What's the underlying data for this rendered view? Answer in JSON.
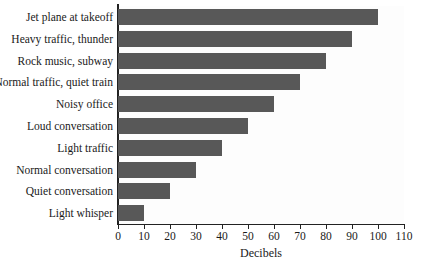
{
  "chart_data": {
    "type": "bar",
    "orientation": "horizontal",
    "title": "",
    "xlabel": "Decibels",
    "ylabel": "",
    "categories": [
      "Jet plane at takeoff",
      "Heavy traffic, thunder",
      "Rock music, subway",
      "Normal traffic, quiet train",
      "Noisy office",
      "Loud conversation",
      "Light traffic",
      "Normal conversation",
      "Quiet conversation",
      "Light whisper"
    ],
    "values": [
      100,
      90,
      80,
      70,
      60,
      50,
      40,
      30,
      20,
      10
    ],
    "xlim": [
      0,
      110
    ],
    "xticks": [
      0,
      10,
      20,
      30,
      40,
      50,
      60,
      70,
      80,
      90,
      100,
      110
    ],
    "xtick_labels": [
      "0",
      "10",
      "20",
      "30",
      "40",
      "50",
      "60",
      "70",
      "80",
      "90",
      "100",
      "110"
    ],
    "grid": false,
    "legend": false,
    "bar_color": "#585858",
    "axis_color": "#222222",
    "background_color": "#ffffff"
  }
}
